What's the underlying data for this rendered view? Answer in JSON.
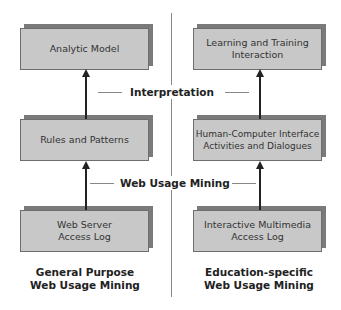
{
  "diagram": {
    "left_column": {
      "boxes": [
        {
          "label": "Analytic Model"
        },
        {
          "label": "Rules and Patterns"
        },
        {
          "label": "Web Server\nAccess Log"
        }
      ],
      "caption": "General Purpose\nWeb Usage Mining"
    },
    "right_column": {
      "boxes": [
        {
          "label": "Learning and Training\nInteraction"
        },
        {
          "label": "Human-Computer Interface\nActivities and Dialogues"
        },
        {
          "label": "Interactive Multimedia\nAccess Log"
        }
      ],
      "caption": "Education-specific\nWeb Usage Mining"
    },
    "stage_labels": {
      "upper": "Interpretation",
      "lower": "Web Usage Mining"
    },
    "colors": {
      "box_fill": "#c8c8c8",
      "box_shadow": "#7a7a7a",
      "arrow": "#222222",
      "divider": "#888888"
    }
  }
}
